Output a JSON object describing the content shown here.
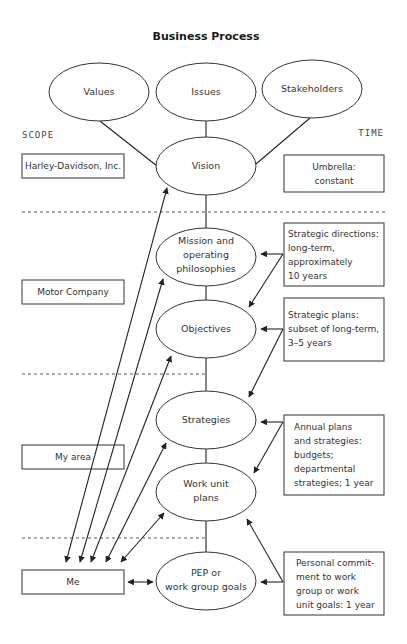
{
  "title": "Business Process",
  "axis": {
    "scope": "SCOPE",
    "time": "TIME"
  },
  "top_ellipses": [
    {
      "id": "values",
      "label": "Values"
    },
    {
      "id": "issues",
      "label": "Issues"
    },
    {
      "id": "stakeholders",
      "label": "Stakeholders"
    }
  ],
  "process": [
    {
      "id": "vision",
      "lines": [
        "Vision"
      ]
    },
    {
      "id": "mission",
      "lines": [
        "Mission and",
        "operating",
        "philosophies"
      ]
    },
    {
      "id": "objectives",
      "lines": [
        "Objectives"
      ]
    },
    {
      "id": "strategies",
      "lines": [
        "Strategies"
      ]
    },
    {
      "id": "work_unit_plans",
      "lines": [
        "Work unit",
        "plans"
      ]
    },
    {
      "id": "pep",
      "lines": [
        "PEP or",
        "work group goals"
      ]
    }
  ],
  "scope_boxes": [
    {
      "id": "harley",
      "label": "Harley-Davidson, Inc."
    },
    {
      "id": "motor",
      "label": "Motor Company"
    },
    {
      "id": "my_area",
      "label": "My area"
    },
    {
      "id": "me",
      "label": "Me"
    }
  ],
  "time_boxes": [
    {
      "id": "umbrella",
      "lines": [
        "Umbrella:",
        "constant"
      ]
    },
    {
      "id": "strategic_directions",
      "lines": [
        "Strategic directions:",
        "long-term,",
        "approximately",
        "10 years"
      ]
    },
    {
      "id": "strategic_plans",
      "lines": [
        "Strategic plans:",
        "subset of long-term,",
        "3–5 years"
      ]
    },
    {
      "id": "annual_plans",
      "lines": [
        "Annual plans",
        "and strategies:",
        "budgets;",
        "departmental",
        "strategies; 1 year"
      ]
    },
    {
      "id": "personal_commitment",
      "lines": [
        "Personal commit-",
        "ment to work",
        "group or work",
        "unit goals: 1 year"
      ]
    }
  ]
}
